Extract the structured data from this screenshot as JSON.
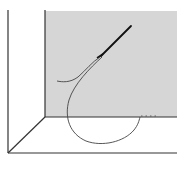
{
  "figure": {
    "colors": {
      "background": "#ffffff",
      "wall_fill": "#d6d6d6",
      "edge_lines": "#333333",
      "needle": "#111111",
      "thread": "#444444"
    },
    "elements": [
      "back-wall",
      "left-wall-edge",
      "floor-diagonal-edge",
      "floor-front-edge",
      "needle",
      "thread-loop",
      "thread-tail"
    ]
  }
}
